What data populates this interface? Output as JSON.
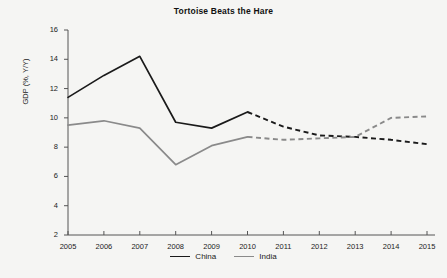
{
  "chart_data": {
    "type": "line",
    "title": "Tortoise Beats the Hare",
    "xlabel": "",
    "ylabel": "GDP (%, Y/Y)",
    "x": [
      2005,
      2006,
      2007,
      2008,
      2009,
      2010,
      2011,
      2012,
      2013,
      2014,
      2015
    ],
    "xticklabels": [
      "2005",
      "2006",
      "2007",
      "2008",
      "2009",
      "2010",
      "2011",
      "2012",
      "2013",
      "2014",
      "2015"
    ],
    "yticklabels": [
      "2",
      "4",
      "6",
      "8",
      "10",
      "12",
      "14",
      "16"
    ],
    "yticks": [
      2,
      4,
      6,
      8,
      10,
      12,
      14,
      16
    ],
    "ylim": [
      2,
      16
    ],
    "xlim": [
      2005,
      2015
    ],
    "grid": false,
    "legend_position": "bottom-center",
    "forecast_starts": 2010,
    "series": [
      {
        "name": "China",
        "color": "#1a1a1a",
        "values": [
          11.4,
          12.9,
          14.2,
          9.7,
          9.3,
          10.4,
          9.4,
          8.8,
          8.7,
          8.5,
          8.2
        ],
        "actual_values": [
          11.4,
          12.9,
          14.2,
          9.7,
          9.3,
          10.4
        ],
        "forecast_values": [
          10.4,
          9.4,
          8.8,
          8.7,
          8.5,
          8.2
        ]
      },
      {
        "name": "India",
        "color": "#8a8a8a",
        "values": [
          9.5,
          9.8,
          9.3,
          6.8,
          8.1,
          8.7,
          8.5,
          8.6,
          8.7,
          10.0,
          10.1
        ],
        "actual_values": [
          9.5,
          9.8,
          9.3,
          6.8,
          8.1,
          8.7
        ],
        "forecast_values": [
          8.7,
          8.5,
          8.6,
          8.7,
          10.0,
          10.1
        ]
      }
    ]
  },
  "legend": {
    "items": [
      {
        "label": "China",
        "color": "#1a1a1a"
      },
      {
        "label": "India",
        "color": "#8a8a8a"
      }
    ]
  }
}
